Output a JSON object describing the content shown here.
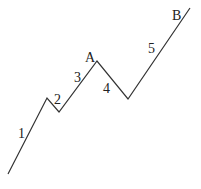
{
  "diagram": {
    "line_color": "#333333",
    "points": [
      [
        8,
        174
      ],
      [
        47,
        98
      ],
      [
        59,
        112
      ],
      [
        97,
        61
      ],
      [
        128,
        99
      ],
      [
        190,
        8
      ]
    ],
    "waves": [
      {
        "label": "1",
        "x": 18,
        "y": 138
      },
      {
        "label": "2",
        "x": 54,
        "y": 104
      },
      {
        "label": "3",
        "x": 74,
        "y": 82
      },
      {
        "label": "4",
        "x": 103,
        "y": 93
      },
      {
        "label": "5",
        "x": 148,
        "y": 53
      }
    ],
    "points_labels": [
      {
        "label": "A",
        "x": 85,
        "y": 62
      },
      {
        "label": "B",
        "x": 172,
        "y": 20
      }
    ]
  }
}
